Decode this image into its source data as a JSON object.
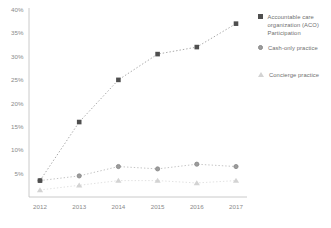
{
  "chart_data": {
    "type": "line",
    "title": "",
    "xlabel": "",
    "ylabel": "",
    "categories": [
      "2012",
      "2013",
      "2014",
      "2015",
      "2016",
      "2017"
    ],
    "ylim": [
      0,
      40
    ],
    "y_ticks": [
      "40%",
      "35%",
      "30%",
      "25%",
      "20%",
      "15%",
      "10%",
      "5%"
    ],
    "y_tick_values": [
      40,
      35,
      30,
      25,
      20,
      15,
      10,
      5
    ],
    "grid": false,
    "legend_position": "right",
    "line_style": "dotted",
    "axis_color": "#bdbdbd",
    "tick_label_color": "#8a8a8a",
    "series": [
      {
        "name": "Accountable care organization (ACO) Participation",
        "marker": "square",
        "marker_color": "#4f4f4f",
        "marker_edge": "#4f4f4f",
        "line_color": "#9e9e9e",
        "values": [
          3.5,
          16,
          25,
          30.5,
          32,
          37
        ]
      },
      {
        "name": "Cash-only practice",
        "marker": "circle",
        "marker_color": "#9c9c9c",
        "marker_edge": "#878787",
        "line_color": "#bdbdbd",
        "values": [
          3.5,
          4.5,
          6.5,
          6,
          7,
          6.5
        ]
      },
      {
        "name": "Concierge practice",
        "marker": "triangle",
        "marker_color": "#d3d3d3",
        "marker_edge": "#d3d3d3",
        "line_color": "#dedede",
        "values": [
          1.5,
          2.5,
          3.5,
          3.5,
          3,
          3.5
        ]
      }
    ]
  }
}
